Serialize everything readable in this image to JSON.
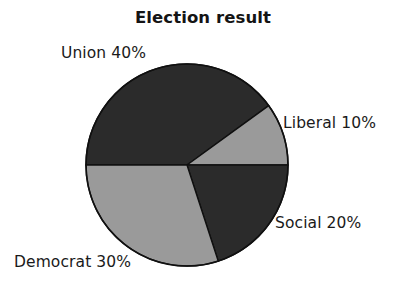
{
  "chart_data": {
    "type": "pie",
    "title": "Election result",
    "xlabel": "",
    "ylabel": "",
    "legend_position": "none",
    "grid": false,
    "categories": [
      "Union",
      "Liberal",
      "Social",
      "Democrat"
    ],
    "values": [
      40,
      10,
      20,
      30
    ],
    "value_unit": "%",
    "labels": [
      "Union 40%",
      "Liberal 10%",
      "Social 20%",
      "Democrat 30%"
    ],
    "slices": [
      {
        "name": "Union",
        "label": "Union 40%",
        "value": 40,
        "color": "#2b2b2b",
        "start_angle_deg": 270,
        "end_angle_deg": 412,
        "label_position": "upper-left"
      },
      {
        "name": "Liberal",
        "label": "Liberal 10%",
        "value": 10,
        "color": "#9a9a9a",
        "start_angle_deg": 52,
        "end_angle_deg": 90,
        "label_position": "right"
      },
      {
        "name": "Social",
        "label": "Social 20%",
        "value": 20,
        "color": "#2b2b2b",
        "start_angle_deg": 90,
        "end_angle_deg": 165,
        "label_position": "lower-right"
      },
      {
        "name": "Democrat",
        "label": "Democrat 30%",
        "value": 30,
        "color": "#9a9a9a",
        "start_angle_deg": 165,
        "end_angle_deg": 270,
        "label_position": "bottom-left"
      }
    ],
    "colors": {
      "dark": "#2b2b2b",
      "light": "#9a9a9a",
      "outline": "#101010",
      "background": "#ffffff",
      "text": "#1a1a1a"
    },
    "geometry": {
      "center_x": 187,
      "center_y": 165,
      "radius": 101
    }
  }
}
